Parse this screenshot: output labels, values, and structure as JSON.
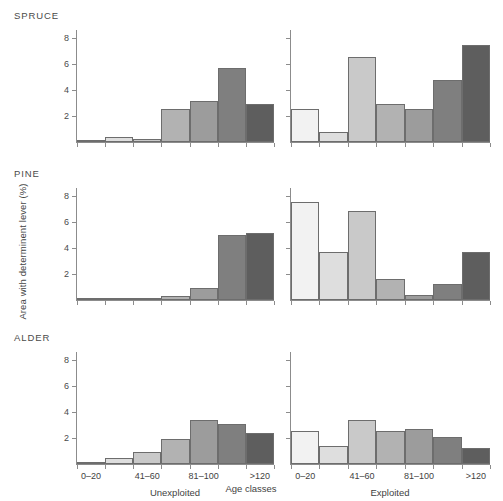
{
  "figure": {
    "ylabel": "Area with determinent lever (%)",
    "xlabel": "Age classes",
    "row_titles": [
      "SPRUCE",
      "PINE",
      "ALDER"
    ],
    "column_captions": [
      "Unexploited",
      "Exploited"
    ]
  },
  "axes": {
    "ytick_labels": [
      "8",
      "6",
      "4",
      "2"
    ],
    "ytick_values": [
      8,
      6,
      4,
      2
    ],
    "ylim": [
      0,
      8.6
    ],
    "xtick_labels": [
      "0–20",
      "41–60",
      "81–100",
      ">120"
    ],
    "grid": "off",
    "legend": "none"
  },
  "palette": {
    "bar_border": "#6d6d6d",
    "axis": "#8c8c8c",
    "text": "#3f3f3f",
    "background": "#ffffff",
    "bar_fills": [
      "#f2f2f2",
      "#dedede",
      "#c9c9c9",
      "#b2b2b2",
      "#9c9c9c",
      "#7f7f7f",
      "#5e5e5e"
    ]
  },
  "chart_data": {
    "type": "bar",
    "title": "",
    "xlabel": "Age classes",
    "ylabel": "Area with determinent lever (%)",
    "ylim": [
      0,
      8.6
    ],
    "yticks": [
      2,
      4,
      6,
      8
    ],
    "categories": [
      "0–20",
      "21–40",
      "41–60",
      "61–80",
      "81–100",
      "101–120",
      ">120"
    ],
    "visible_tick_labels": [
      "0–20",
      "41–60",
      "81–100",
      ">120"
    ],
    "panels": [
      {
        "row": "SPRUCE",
        "column": "Unexploited",
        "values": [
          0.15,
          0.35,
          0.2,
          2.5,
          3.15,
          5.7,
          2.95
        ]
      },
      {
        "row": "SPRUCE",
        "column": "Exploited",
        "values": [
          2.55,
          0.8,
          6.5,
          2.9,
          2.55,
          4.8,
          7.45
        ]
      },
      {
        "row": "PINE",
        "column": "Unexploited",
        "values": [
          0.05,
          0.05,
          0.05,
          0.3,
          0.9,
          5.0,
          5.15
        ]
      },
      {
        "row": "PINE",
        "column": "Exploited",
        "values": [
          7.55,
          3.65,
          6.8,
          1.6,
          0.35,
          1.2,
          3.7
        ]
      },
      {
        "row": "ALDER",
        "column": "Unexploited",
        "values": [
          0.05,
          0.5,
          0.9,
          1.9,
          3.35,
          3.1,
          2.4
        ]
      },
      {
        "row": "ALDER",
        "column": "Exploited",
        "values": [
          2.5,
          1.35,
          3.35,
          2.5,
          2.7,
          2.05,
          1.2
        ]
      }
    ]
  },
  "layout": {
    "panel_rows_top": [
      30,
      188,
      352
    ],
    "panel_height": 113,
    "title_offsets_top": [
      10,
      168,
      332
    ],
    "col_left": [
      76,
      290
    ],
    "col_width": [
      198,
      200
    ]
  }
}
